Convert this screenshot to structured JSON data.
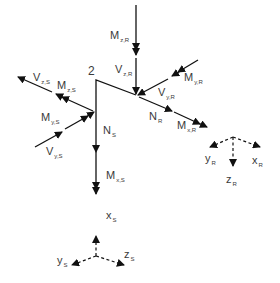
{
  "diagram": {
    "title": "",
    "node_label": "2",
    "forces_R": {
      "M_z": {
        "main": "M",
        "sub": "z,R"
      },
      "V_z": {
        "main": "V",
        "sub": "z,R"
      },
      "M_y": {
        "main": "M",
        "sub": "y,R"
      },
      "V_y": {
        "main": "V",
        "sub": "y,R"
      },
      "N": {
        "main": "N",
        "sub": "R"
      },
      "M_x": {
        "main": "M",
        "sub": "x,R"
      }
    },
    "forces_S": {
      "V_z": {
        "main": "V",
        "sub": "z,S"
      },
      "M_z": {
        "main": "M",
        "sub": "z,S"
      },
      "M_y": {
        "main": "M",
        "sub": "y,S"
      },
      "V_y": {
        "main": "V",
        "sub": "y,S"
      },
      "N": {
        "main": "N",
        "sub": "S"
      },
      "M_x": {
        "main": "M",
        "sub": "x,S"
      }
    },
    "axes_S": {
      "x": {
        "main": "x",
        "sub": "S"
      },
      "y": {
        "main": "y",
        "sub": "S"
      },
      "z": {
        "main": "z",
        "sub": "S"
      }
    },
    "axes_R": {
      "x": {
        "main": "x",
        "sub": "R"
      },
      "y": {
        "main": "y",
        "sub": "R"
      },
      "z": {
        "main": "z",
        "sub": "R"
      }
    },
    "colors": {
      "line": "#111111",
      "text": "#3a3a3a"
    }
  }
}
